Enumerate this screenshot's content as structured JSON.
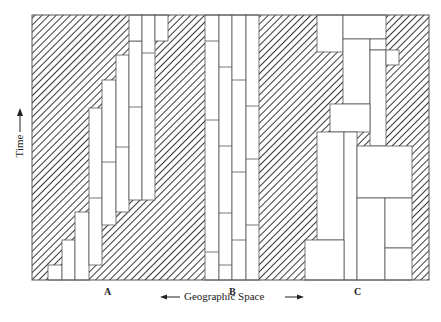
{
  "diagram": {
    "y_axis_label": "Time",
    "x_axis_label": "Geographic Space",
    "region_labels": [
      "A",
      "B",
      "C"
    ],
    "hatch_color": "#3a3a3a",
    "line_color": "#555555",
    "frame": {
      "x1": 32,
      "y1": 15,
      "x2": 429,
      "y2": 280
    },
    "hatched_regions": [
      {
        "name": "hatch-A",
        "points": "32,15 129,15 129,41 116,41 116,55 102,55 102,80 89,80 89,108 75,108 75,212 62,212 62,240 48,240 48,265 32,265"
      },
      {
        "name": "hatch-A-right",
        "points": "142,15 155,15 155,41 168,41 168,15 205,15 205,280 89,280 89,265 102,265 102,225 116,225 116,212 129,212 129,200 142,200"
      },
      {
        "name": "hatch-A-bottom-left",
        "points": "32,265 48,265 48,280 32,280"
      },
      {
        "name": "hatch-B-right",
        "points": "259,15 300,15 300,280 259,280"
      },
      {
        "name": "hatch-C-left",
        "points": "300,15 317,15 317,52 343,52 343,104 330,104 330,132 317,132 317,240 305,240 305,280 300,280"
      },
      {
        "name": "hatch-C-right",
        "points": "386,15 416,15 416,280 412,280 412,146 399,146 399,65 386,65"
      }
    ],
    "cells_A": [
      {
        "x": 48,
        "y": 265,
        "w": 14,
        "h": 15
      },
      {
        "x": 62,
        "y": 240,
        "w": 13,
        "h": 40
      },
      {
        "x": 75,
        "y": 212,
        "w": 14,
        "h": 68
      },
      {
        "x": 89,
        "y": 108,
        "w": 13,
        "h": 157,
        "dividers": [
          198
        ]
      },
      {
        "x": 102,
        "y": 80,
        "w": 14,
        "h": 145,
        "dividers": [
          162
        ]
      },
      {
        "x": 116,
        "y": 55,
        "w": 13,
        "h": 157,
        "dividers": [
          147
        ]
      },
      {
        "x": 129,
        "y": 41,
        "w": 13,
        "h": 159,
        "dividers": [
          107
        ]
      },
      {
        "x": 129,
        "y": 15,
        "w": 13,
        "h": 26
      },
      {
        "x": 142,
        "y": 15,
        "w": 13,
        "h": 185,
        "dividers": [
          53
        ]
      },
      {
        "x": 155,
        "y": 15,
        "w": 13,
        "h": 26
      }
    ],
    "cells_B": [
      {
        "x": 205,
        "y": 15,
        "w": 14,
        "h": 265,
        "dividers": [
          41,
          120,
          252
        ]
      },
      {
        "x": 219,
        "y": 15,
        "w": 13,
        "h": 265,
        "dividers": [
          67,
          146,
          213,
          265
        ]
      },
      {
        "x": 232,
        "y": 15,
        "w": 14,
        "h": 265,
        "dividers": [
          80,
          172,
          240
        ]
      },
      {
        "x": 246,
        "y": 15,
        "w": 13,
        "h": 265,
        "dividers": [
          106,
          159,
          225
        ]
      }
    ],
    "cells_C": [
      {
        "x": 317,
        "y": 15,
        "w": 26,
        "h": 37
      },
      {
        "x": 343,
        "y": 15,
        "w": 43,
        "h": 24
      },
      {
        "x": 343,
        "y": 39,
        "w": 27,
        "h": 65
      },
      {
        "x": 370,
        "y": 39,
        "w": 16,
        "h": 11
      },
      {
        "x": 370,
        "y": 50,
        "w": 16,
        "h": 96
      },
      {
        "x": 386,
        "y": 50,
        "w": 13,
        "h": 15
      },
      {
        "x": 330,
        "y": 104,
        "w": 40,
        "h": 28
      },
      {
        "x": 317,
        "y": 132,
        "w": 27,
        "h": 108
      },
      {
        "x": 344,
        "y": 132,
        "w": 13,
        "h": 148
      },
      {
        "x": 357,
        "y": 146,
        "w": 55,
        "h": 52
      },
      {
        "x": 357,
        "y": 198,
        "w": 28,
        "h": 82
      },
      {
        "x": 385,
        "y": 198,
        "w": 27,
        "h": 50
      },
      {
        "x": 385,
        "y": 248,
        "w": 27,
        "h": 32
      },
      {
        "x": 305,
        "y": 240,
        "w": 39,
        "h": 40
      }
    ]
  }
}
